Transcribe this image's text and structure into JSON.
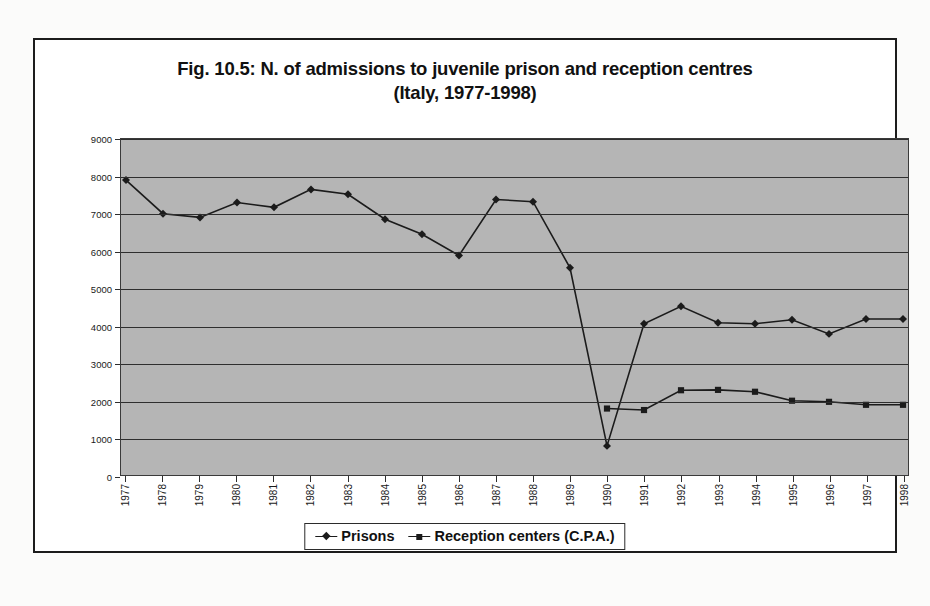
{
  "figure": {
    "title_line1": "Fig. 10.5: N. of admissions to juvenile prison and reception centres",
    "title_line2": "(Italy, 1977-1998)"
  },
  "legend": {
    "items": [
      {
        "label": "Prisons",
        "marker": "diamond-marker-icon",
        "color": "#1b1b1b"
      },
      {
        "label": "Reception centers (C.P.A.)",
        "marker": "square-marker-icon",
        "color": "#1b1b1b"
      }
    ]
  },
  "style": {
    "plot_background": "#b5b5b5",
    "gridline_color": "#2e2e2e",
    "line_color": "#1b1b1b",
    "frame_color": "#1c1c1c"
  },
  "chart_data": {
    "type": "line",
    "title": "Fig. 10.5: N. of admissions to juvenile prison and reception centres (Italy, 1977-1998)",
    "xlabel": "",
    "ylabel": "",
    "x": [
      1977,
      1978,
      1979,
      1980,
      1981,
      1982,
      1983,
      1984,
      1985,
      1986,
      1987,
      1988,
      1989,
      1990,
      1991,
      1992,
      1993,
      1994,
      1995,
      1996,
      1997,
      1998
    ],
    "categories": [
      "1977",
      "1978",
      "1979",
      "1980",
      "1981",
      "1982",
      "1983",
      "1984",
      "1985",
      "1986",
      "1987",
      "1988",
      "1989",
      "1990",
      "1991",
      "1992",
      "1993",
      "1994",
      "1995",
      "1996",
      "1997",
      "1998"
    ],
    "ylim": [
      0,
      9000
    ],
    "yticks": [
      0,
      1000,
      2000,
      3000,
      4000,
      5000,
      6000,
      7000,
      8000,
      9000
    ],
    "ytick_labels": [
      "0",
      "1000",
      "2000",
      "3000",
      "4000",
      "5000",
      "6000",
      "7000",
      "8000",
      "9000"
    ],
    "grid": true,
    "legend_position": "bottom-center",
    "series": [
      {
        "name": "Prisons",
        "marker": "diamond",
        "values": [
          7900,
          7000,
          6900,
          7300,
          7170,
          7650,
          7520,
          6850,
          6450,
          5880,
          7380,
          7320,
          5550,
          780,
          4050,
          4520,
          4080,
          4050,
          4160,
          3780,
          4180,
          4180
        ]
      },
      {
        "name": "Reception centers (C.P.A.)",
        "marker": "square",
        "values": [
          null,
          null,
          null,
          null,
          null,
          null,
          null,
          null,
          null,
          null,
          null,
          null,
          null,
          1780,
          1740,
          2270,
          2280,
          2230,
          1990,
          1960,
          1880,
          1880
        ]
      }
    ]
  }
}
